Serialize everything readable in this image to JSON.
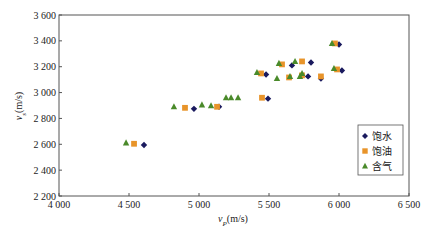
{
  "chart_data": {
    "type": "scatter",
    "title": "",
    "xlabel": "v_P(m/s)",
    "ylabel": "v_s(m/s)",
    "xlabel_main": "v",
    "xlabel_sub": "P",
    "xlabel_unit": "(m/s)",
    "ylabel_main": "v",
    "ylabel_sub": "s",
    "ylabel_unit": "(m/s)",
    "xlim": [
      4000,
      6500
    ],
    "ylim": [
      2200,
      3600
    ],
    "x_ticks": [
      4000,
      4500,
      5000,
      5500,
      6000,
      6500
    ],
    "x_tick_labels": [
      "4 000",
      "4 500",
      "5 000",
      "5 500",
      "6 000",
      "6 500"
    ],
    "y_ticks": [
      2200,
      2400,
      2600,
      2800,
      3000,
      3200,
      3400,
      3600
    ],
    "y_tick_labels": [
      "2 200",
      "2 400",
      "2 600",
      "2 800",
      "3 000",
      "3 200",
      "3 400",
      "3 600"
    ],
    "grid": false,
    "legend_position": "lower right",
    "series": [
      {
        "name": "饱水",
        "marker": "diamond",
        "color": "#1a1a5e",
        "points": [
          [
            4607,
            2595
          ],
          [
            4964,
            2874
          ],
          [
            5143,
            2890
          ],
          [
            5493,
            2953
          ],
          [
            5479,
            3140
          ],
          [
            5664,
            3210
          ],
          [
            5800,
            3233
          ],
          [
            5779,
            3125
          ],
          [
            5871,
            3109
          ],
          [
            6000,
            3372
          ],
          [
            6021,
            3171
          ]
        ]
      },
      {
        "name": "饱油",
        "marker": "square",
        "color": "#e8942a",
        "points": [
          [
            4536,
            2604
          ],
          [
            4900,
            2882
          ],
          [
            5129,
            2890
          ],
          [
            5450,
            2960
          ],
          [
            5443,
            3148
          ],
          [
            5593,
            3218
          ],
          [
            5736,
            3241
          ],
          [
            5643,
            3117
          ],
          [
            5736,
            3133
          ],
          [
            5871,
            3125
          ],
          [
            5971,
            3380
          ],
          [
            5986,
            3179
          ]
        ]
      },
      {
        "name": "含气",
        "marker": "triangle",
        "color": "#4a8a2a",
        "points": [
          [
            4479,
            2611
          ],
          [
            4821,
            2890
          ],
          [
            5021,
            2905
          ],
          [
            5086,
            2898
          ],
          [
            5193,
            2960
          ],
          [
            5229,
            2960
          ],
          [
            5279,
            2960
          ],
          [
            5414,
            3156
          ],
          [
            5571,
            3226
          ],
          [
            5686,
            3241
          ],
          [
            5557,
            3109
          ],
          [
            5650,
            3125
          ],
          [
            5736,
            3148
          ],
          [
            5721,
            3125
          ],
          [
            5950,
            3380
          ],
          [
            5964,
            3187
          ]
        ]
      }
    ]
  },
  "legend": {
    "items": [
      {
        "label": "饱水",
        "marker": "diamond",
        "color": "#1a1a5e"
      },
      {
        "label": "饱油",
        "marker": "square",
        "color": "#e8942a"
      },
      {
        "label": "含气",
        "marker": "triangle",
        "color": "#4a8a2a"
      }
    ]
  }
}
